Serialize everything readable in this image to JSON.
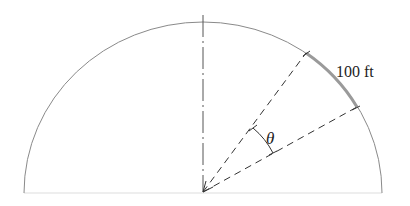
{
  "diagram": {
    "type": "semicircle-arc-geometry",
    "center": {
      "x": 203,
      "y": 192
    },
    "radius_x": 179,
    "radius_y": 170,
    "arc_label": "100 ft",
    "angle_label": "θ",
    "colors": {
      "arc": "#8a8a8a",
      "chord": "#9a9a9a",
      "dashed": "#333333",
      "baseline": "#dddddd",
      "text": "#222222"
    }
  }
}
